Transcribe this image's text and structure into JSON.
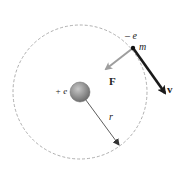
{
  "diagram": {
    "labels": {
      "electron_charge": "– e",
      "electron_mass": "m",
      "nucleus_charge": "+ e",
      "force": "F",
      "velocity": "v",
      "radius": "r"
    },
    "colors": {
      "orbit": "#9a9a9a",
      "nucleus": "#8a8a8a",
      "force_arrow": "#9e9e9e",
      "velocity_arrow": "#1a1a1a",
      "radius_line": "#333333"
    }
  }
}
